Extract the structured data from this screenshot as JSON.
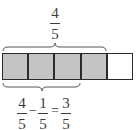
{
  "diagram": {
    "total_parts": 5,
    "shaded_parts": 4,
    "colors": {
      "shaded": "#c4c4c4",
      "empty": "#ffffff",
      "stroke": "#2a2a2a",
      "text": "#3a3a3a"
    },
    "top_brace": {
      "spans_parts": 4,
      "label": {
        "numerator": "4",
        "denominator": "5"
      }
    },
    "bottom_brace": {
      "spans_parts": 3,
      "equation": {
        "term1": {
          "numerator": "4",
          "denominator": "5"
        },
        "operator1": "−",
        "term2": {
          "numerator": "1",
          "denominator": "5"
        },
        "operator2": "=",
        "result": {
          "numerator": "3",
          "denominator": "5"
        }
      }
    }
  }
}
